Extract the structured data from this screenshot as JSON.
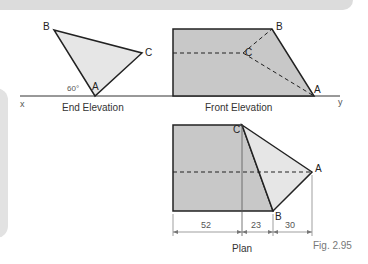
{
  "figure": {
    "caption": "Fig. 2.95",
    "axis": {
      "left": "x",
      "right": "y"
    },
    "views": {
      "end_elevation": {
        "title": "End Elevation",
        "points": [
          "A",
          "B",
          "C"
        ],
        "angle_label": "60°"
      },
      "front_elevation": {
        "title": "Front Elevation",
        "points": [
          "A",
          "B",
          "C"
        ]
      },
      "plan": {
        "title": "Plan",
        "points": [
          "A",
          "B",
          "C"
        ]
      }
    },
    "dimensions": [
      "52",
      "23",
      "30"
    ],
    "colors": {
      "dark_fill": "#c8c8c8",
      "light_fill": "#e4e4e4",
      "line": "#222222",
      "panel": "#dcdcdc"
    }
  }
}
